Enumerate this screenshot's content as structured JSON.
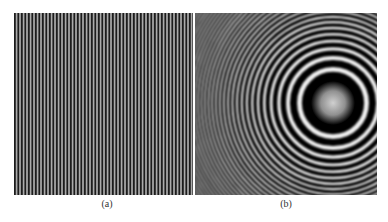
{
  "figure": {
    "panels": [
      {
        "id": "a",
        "label": "(a)",
        "description": "vertical linear grating fringe pattern",
        "stripe_period_px": 3.5,
        "dark": "#1a1a1a",
        "light": "#d8d8d8"
      },
      {
        "id": "b",
        "label": "(b)",
        "description": "concentric circular fringe pattern (Fresnel zone-like)",
        "center": [
          138,
          90
        ],
        "dark": "#000000",
        "light": "#f2f2f2",
        "center_glow": "#c8c8c8"
      }
    ]
  }
}
